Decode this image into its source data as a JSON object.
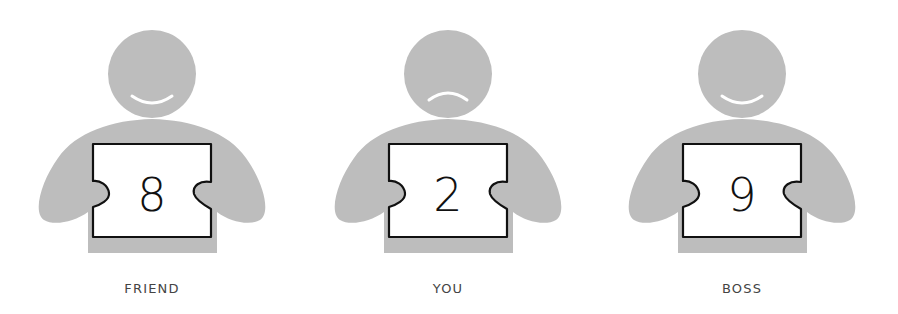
{
  "colors": {
    "figure_fill": "#bdbdbd",
    "card_fill": "#ffffff",
    "card_stroke": "#111111",
    "mouth_stroke": "#ffffff",
    "label_text": "#444444"
  },
  "figures": [
    {
      "role": "friend",
      "label": "FRIEND",
      "score": "8",
      "expression": "smile",
      "center_x": 152
    },
    {
      "role": "you",
      "label": "YOU",
      "score": "2",
      "expression": "frown",
      "center_x": 448
    },
    {
      "role": "boss",
      "label": "BOSS",
      "score": "9",
      "expression": "smile",
      "center_x": 742
    }
  ]
}
